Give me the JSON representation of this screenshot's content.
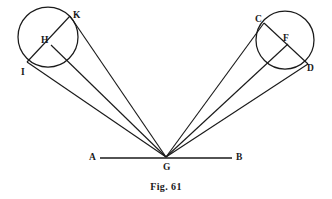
{
  "figure": {
    "caption": "Fig. 61",
    "background_color": "#ffffff",
    "ink_color": "#1a1a1a",
    "width": 332,
    "height": 199
  },
  "baseline": {
    "label_left": "A",
    "label_right": "B",
    "vertex_label": "G",
    "x_start": 100,
    "x_end": 232,
    "y": 158,
    "vertex_x": 166,
    "vertex_y": 157
  },
  "circles": [
    {
      "name": "left-circle",
      "cx": 48,
      "cy": 37,
      "r": 30
    },
    {
      "name": "right-circle",
      "cx": 285,
      "cy": 40,
      "r": 29
    }
  ],
  "points": [
    {
      "id": "K",
      "label": "K",
      "x": 70,
      "y": 16,
      "label_x": 73,
      "label_y": 11
    },
    {
      "id": "H",
      "label": "H",
      "x": 51,
      "y": 45,
      "label_x": 41,
      "label_y": 36
    },
    {
      "id": "I",
      "label": "I",
      "x": 27,
      "y": 62,
      "label_x": 21,
      "label_y": 68
    },
    {
      "id": "C",
      "label": "C",
      "x": 264,
      "y": 23,
      "label_x": 255,
      "label_y": 15
    },
    {
      "id": "F",
      "label": "F",
      "x": 288,
      "y": 44,
      "label_x": 283,
      "label_y": 34
    },
    {
      "id": "D",
      "label": "D",
      "x": 308,
      "y": 64,
      "label_x": 307,
      "label_y": 64
    }
  ],
  "rays": [
    {
      "name": "ray-G-I",
      "from": "G",
      "to": "I"
    },
    {
      "name": "ray-G-H",
      "from": "G",
      "to": "H"
    },
    {
      "name": "ray-G-K",
      "from": "G",
      "to": "K"
    },
    {
      "name": "ray-G-C",
      "from": "G",
      "to": "C"
    },
    {
      "name": "ray-G-F",
      "from": "G",
      "to": "F"
    },
    {
      "name": "ray-G-D",
      "from": "G",
      "to": "D"
    }
  ],
  "chords": [
    {
      "name": "chord-I-K",
      "from": "I",
      "to": "K"
    },
    {
      "name": "chord-C-D",
      "from": "C",
      "to": "D"
    }
  ]
}
